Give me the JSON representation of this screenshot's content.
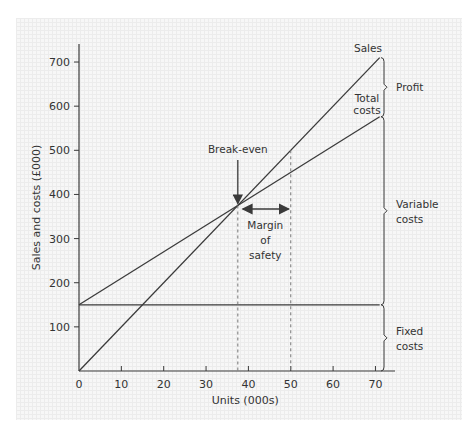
{
  "figure_label": "(a)",
  "chart_data": {
    "type": "line",
    "title": "",
    "xlabel": "Units (000s)",
    "ylabel": "Sales and costs (£000)",
    "xlim": [
      0,
      72
    ],
    "ylim": [
      0,
      740
    ],
    "x_ticks": [
      0,
      10,
      20,
      30,
      40,
      50,
      60,
      70
    ],
    "y_ticks": [
      100,
      200,
      300,
      400,
      500,
      600,
      700
    ],
    "grid": false,
    "series": [
      {
        "name": "Sales",
        "x": [
          0,
          71
        ],
        "values": [
          0,
          710
        ]
      },
      {
        "name": "Total costs",
        "x": [
          0,
          71
        ],
        "values": [
          150,
          576
        ]
      },
      {
        "name": "Fixed costs",
        "x": [
          0,
          71
        ],
        "values": [
          150,
          150
        ]
      }
    ],
    "annotations": {
      "break_even": {
        "label": "Break-even",
        "units": 37.5,
        "value": 375
      },
      "margin_of_safety": {
        "label_lines": [
          "Margin",
          "of",
          "safety"
        ],
        "from_units": 37.5,
        "to_units": 50
      },
      "reference_line_units": 50,
      "braces": [
        {
          "label_lines": [
            "Profit"
          ],
          "from": 576,
          "to": 710
        },
        {
          "label_lines": [
            "Variable",
            "costs"
          ],
          "from": 150,
          "to": 576
        },
        {
          "label_lines": [
            "Fixed",
            "costs"
          ],
          "from": 0,
          "to": 150
        }
      ],
      "line_labels": {
        "sales": "Sales",
        "total_costs_lines": [
          "Total",
          "costs"
        ]
      }
    },
    "colors": {
      "line": "#3a3a3a",
      "text": "#333333",
      "background": "#f7f7f7"
    }
  }
}
